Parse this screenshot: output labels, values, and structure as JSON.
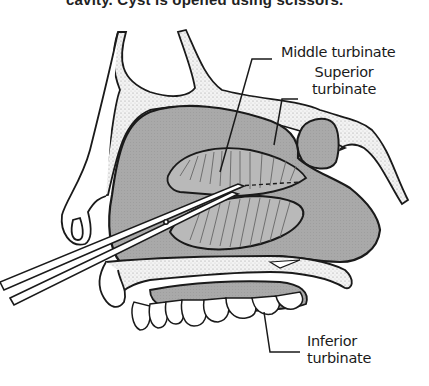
{
  "caption_top": "cavity. Cyst is opened using scissors.",
  "labels": {
    "middle_turbinate": "Middle turbinate",
    "superior_turbinate_line1": "Superior",
    "superior_turbinate_line2": "turbinate",
    "inferior_turbinate_line1": "Inferior",
    "inferior_turbinate_line2": "turbinate"
  },
  "colors": {
    "cavity_gray": "#a9a9a9",
    "ink": "#1a1a1a",
    "background": "#ffffff",
    "bone_fill": "#f4f4f4"
  }
}
